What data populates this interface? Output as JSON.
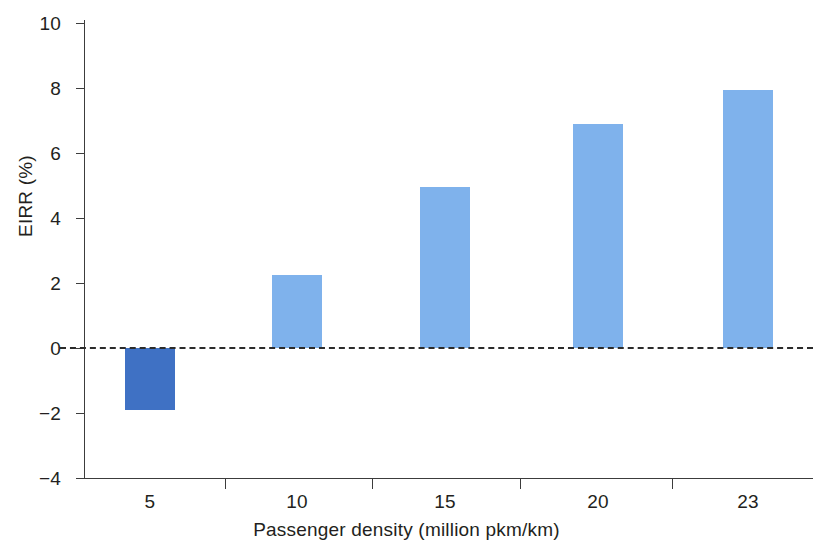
{
  "chart_data": {
    "type": "bar",
    "title": "",
    "xlabel": "Passenger density (million pkm/km)",
    "ylabel": "EIRR (%)",
    "categories": [
      "5",
      "10",
      "15",
      "20",
      "23"
    ],
    "values": [
      -1.9,
      2.25,
      4.95,
      6.9,
      7.95
    ],
    "series": [
      {
        "name": "EIRR",
        "values": [
          -1.9,
          2.25,
          4.95,
          6.9,
          7.95
        ]
      }
    ],
    "ylim": [
      -4,
      10
    ],
    "ytick_labels": [
      "10",
      "8",
      "6",
      "4",
      "2",
      "0",
      "−2",
      "−4"
    ],
    "ytick_values": [
      10,
      8,
      6,
      4,
      2,
      0,
      -2,
      -4
    ],
    "grid": false,
    "legend": "none",
    "zero_reference_line": {
      "value": 0,
      "style": "dashed",
      "color": "#2b2b2b"
    },
    "colors": {
      "positive_bar": "#7fb2ec",
      "negative_bar": "#3f71c4",
      "axis": "#3c3c3c",
      "text": "#231f20",
      "background": "#ffffff"
    },
    "bar_colors": [
      "#3f71c4",
      "#7fb2ec",
      "#7fb2ec",
      "#7fb2ec",
      "#7fb2ec"
    ]
  }
}
